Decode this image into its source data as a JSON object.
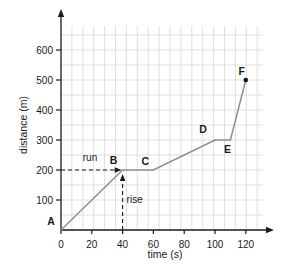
{
  "chart_data": {
    "type": "line",
    "title": "",
    "xlabel": "time (s)",
    "ylabel": "distance (m)",
    "x_ticks": [
      0,
      20,
      40,
      60,
      80,
      100,
      120
    ],
    "y_ticks": [
      100,
      200,
      300,
      400,
      500,
      600
    ],
    "xlim": [
      0,
      137
    ],
    "ylim": [
      0,
      730
    ],
    "grid": true,
    "legend": "none",
    "series": [
      {
        "name": "distance-vs-time",
        "color": "#8f8f8f",
        "points": [
          {
            "label": "A",
            "t": 0,
            "d": 0
          },
          {
            "label": "B",
            "t": 40,
            "d": 200
          },
          {
            "label": "C",
            "t": 60,
            "d": 200
          },
          {
            "label": "D",
            "t": 100,
            "d": 300
          },
          {
            "label": "E",
            "t": 110,
            "d": 300
          },
          {
            "label": "F",
            "t": 120,
            "d": 500,
            "marker": true
          }
        ]
      }
    ],
    "annotations": [
      {
        "id": "run",
        "label": "run",
        "kind": "horizontal-dashed-arrow",
        "from_t": 0,
        "to_point": "B",
        "at_d": 200
      },
      {
        "id": "rise",
        "label": "rise",
        "kind": "vertical-dashed-arrow",
        "from_d": 0,
        "to_point": "B",
        "at_t": 40
      }
    ],
    "colors": {
      "line": "#8f8f8f",
      "axis": "#1a1a1a",
      "grid": "#d7d7d7",
      "dashed": "#1a1a1a",
      "marker": "#111111",
      "text": "#1a1a1a",
      "background": "#ffffff"
    }
  }
}
